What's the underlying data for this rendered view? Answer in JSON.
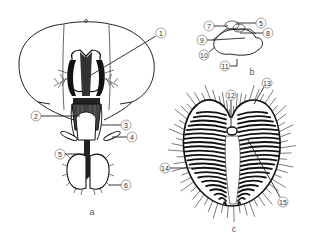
{
  "figure": {
    "panels": [
      {
        "id": "a",
        "label": "a",
        "subject": "fly head, frontal view with proboscis"
      },
      {
        "id": "b",
        "label": "b",
        "subject": "proboscis cross-section"
      },
      {
        "id": "c",
        "label": "c",
        "subject": "labellum, ventral view"
      }
    ],
    "callouts": [
      {
        "n": "1",
        "panel": "a"
      },
      {
        "n": "2",
        "panel": "a"
      },
      {
        "n": "3",
        "panel": "a"
      },
      {
        "n": "4",
        "panel": "a"
      },
      {
        "n": "5",
        "panel": "a"
      },
      {
        "n": "6",
        "panel": "a"
      },
      {
        "n": "7",
        "panel": "b"
      },
      {
        "n": "5",
        "panel": "b"
      },
      {
        "n": "8",
        "panel": "b"
      },
      {
        "n": "9",
        "panel": "b"
      },
      {
        "n": "10",
        "panel": "b"
      },
      {
        "n": "11",
        "panel": "b"
      },
      {
        "n": "12",
        "panel": "c"
      },
      {
        "n": "13",
        "panel": "c"
      },
      {
        "n": "14",
        "panel": "c"
      },
      {
        "n": "15",
        "panel": "c"
      }
    ]
  }
}
